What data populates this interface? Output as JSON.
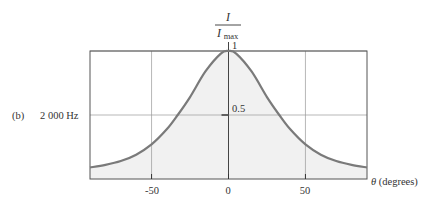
{
  "panel_label": "(b)",
  "frequency_label": "2 000 Hz",
  "colors": {
    "curve": "#7a7a7a",
    "fill": "#f1f1f1",
    "frame": "#555555",
    "grid": "#9a9a9a"
  },
  "chart_data": {
    "type": "area",
    "title": "",
    "xlabel": "θ (degrees)",
    "ylabel": "I / I_max",
    "ylabel_numerator": "I",
    "ylabel_denominator": "I",
    "ylabel_denominator_sub": "max",
    "xlim": [
      -90,
      90
    ],
    "ylim": [
      0,
      1
    ],
    "grid": true,
    "x_ticks": [
      -50,
      0,
      50
    ],
    "x_tick_labels": [
      "-50",
      "0",
      "50"
    ],
    "y_ticks": [
      0.5,
      1
    ],
    "y_tick_labels": [
      "0.5",
      "1"
    ],
    "series": [
      {
        "name": "2 000 Hz",
        "x": [
          -90,
          -80,
          -70,
          -60,
          -50,
          -40,
          -33,
          -25,
          -15,
          -5,
          0,
          5,
          15,
          25,
          33,
          40,
          50,
          60,
          70,
          80,
          90
        ],
        "values": [
          0.09,
          0.11,
          0.14,
          0.19,
          0.27,
          0.39,
          0.5,
          0.64,
          0.84,
          0.98,
          1.0,
          0.98,
          0.84,
          0.64,
          0.5,
          0.39,
          0.27,
          0.19,
          0.14,
          0.11,
          0.09
        ]
      }
    ]
  }
}
